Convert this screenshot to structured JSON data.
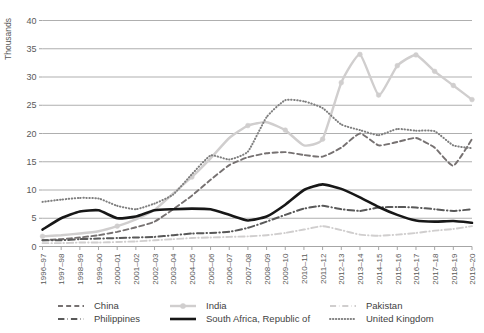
{
  "chart_data": {
    "type": "line",
    "title": "",
    "xlabel": "",
    "ylabel": "Thousands",
    "ylim": [
      0,
      40
    ],
    "ytick_step": 5,
    "yticks": [
      "0",
      "5",
      "10",
      "15",
      "20",
      "25",
      "30",
      "35",
      "40"
    ],
    "grid": true,
    "legend_position": "bottom",
    "categories": [
      "1996–97",
      "1997–98",
      "1998–99",
      "1999–00",
      "2000–01",
      "2001–02",
      "2002–03",
      "2003–04",
      "2004–05",
      "2005–06",
      "2006–07",
      "2007–08",
      "2008–09",
      "2009–10",
      "2010–11",
      "2011–12",
      "2012–13",
      "2013–14",
      "2014–15",
      "2015–16",
      "2016–17",
      "2017–18",
      "2018–19",
      "2019–20"
    ],
    "series": [
      {
        "name": "China",
        "color": "#767171",
        "style": "dashed",
        "width": 1.9,
        "marker": "none",
        "values": [
          1.1,
          1.3,
          1.6,
          2.0,
          2.6,
          3.4,
          4.4,
          6.6,
          9.0,
          11.8,
          14.4,
          15.8,
          16.5,
          16.7,
          16.2,
          15.9,
          17.5,
          20.0,
          17.9,
          18.5,
          19.2,
          17.5,
          14.3,
          19.0
        ]
      },
      {
        "name": "India",
        "color": "#d0cece",
        "style": "solid",
        "width": 2.4,
        "marker": "circle",
        "values": [
          1.8,
          2.0,
          2.3,
          2.7,
          3.6,
          4.8,
          6.5,
          9.4,
          12.3,
          15.6,
          19.2,
          21.4,
          22.0,
          20.6,
          17.9,
          19.0,
          29.0,
          34.0,
          26.8,
          32.0,
          33.9,
          31.0,
          28.5,
          26.0
        ]
      },
      {
        "name": "Pakistan",
        "color": "#d0cece",
        "style": "dashdot",
        "width": 1.9,
        "marker": "none",
        "values": [
          0.6,
          0.6,
          0.7,
          0.7,
          0.8,
          0.9,
          1.1,
          1.3,
          1.5,
          1.6,
          1.7,
          1.8,
          2.0,
          2.4,
          3.0,
          3.6,
          2.9,
          2.1,
          1.9,
          2.1,
          2.4,
          2.8,
          3.1,
          3.6
        ]
      },
      {
        "name": "Philippines",
        "color": "#595959",
        "style": "dashdot",
        "width": 2.0,
        "marker": "none",
        "values": [
          1.1,
          1.1,
          1.3,
          1.4,
          1.5,
          1.6,
          1.7,
          2.0,
          2.3,
          2.4,
          2.6,
          3.3,
          4.4,
          5.6,
          6.7,
          7.2,
          6.6,
          6.3,
          6.9,
          7.0,
          6.9,
          6.6,
          6.3,
          6.6
        ]
      },
      {
        "name": "South Africa, Republic of",
        "color": "#171717",
        "style": "solid",
        "width": 2.6,
        "marker": "none",
        "values": [
          3.0,
          5.0,
          6.2,
          6.4,
          5.0,
          5.3,
          6.4,
          6.6,
          6.7,
          6.6,
          5.6,
          4.6,
          5.3,
          7.4,
          10.0,
          11.0,
          10.2,
          8.7,
          7.0,
          5.6,
          4.6,
          4.4,
          4.5,
          4.2
        ]
      },
      {
        "name": "United Kingdom",
        "color": "#7f7f7f",
        "style": "dotted",
        "width": 2.0,
        "marker": "none",
        "values": [
          7.9,
          8.3,
          8.6,
          8.5,
          7.2,
          6.6,
          7.6,
          9.2,
          12.8,
          16.1,
          15.4,
          16.8,
          22.9,
          25.9,
          25.7,
          24.5,
          21.6,
          20.6,
          19.7,
          20.8,
          20.5,
          20.4,
          17.9,
          17.4
        ]
      }
    ]
  },
  "legend": {
    "items": [
      {
        "label": "China"
      },
      {
        "label": "India"
      },
      {
        "label": "Pakistan"
      },
      {
        "label": "Philippines"
      },
      {
        "label": "South Africa, Republic of"
      },
      {
        "label": "United Kingdom"
      }
    ]
  }
}
